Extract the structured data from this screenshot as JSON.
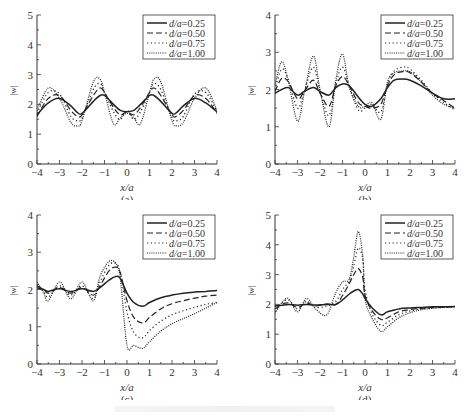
{
  "figure": {
    "panels": [
      {
        "label": "(a)",
        "xlabel": "x/a",
        "ylabel": "|w|"
      },
      {
        "label": "(b)",
        "xlabel": "x/a",
        "ylabel": "|w|"
      },
      {
        "label": "(c)",
        "xlabel": "x/a",
        "ylabel": "|w|"
      },
      {
        "label": "(d)",
        "xlabel": "x/a",
        "ylabel": "|w|"
      }
    ]
  },
  "chart_data": [
    {
      "type": "line",
      "title": "(a)",
      "xlabel": "x/a",
      "ylabel": "|w|",
      "xlim": [
        -4,
        4
      ],
      "ylim": [
        0,
        5
      ],
      "xticks": [
        -4,
        -3,
        -2,
        -1,
        0,
        1,
        2,
        3,
        4
      ],
      "yticks": [
        0,
        1,
        2,
        3,
        4,
        5
      ],
      "grid": false,
      "legend_position": "upper right",
      "x": [
        -4,
        -3.5,
        -3,
        -2.5,
        -2.2,
        -2,
        -1.5,
        -1.2,
        -1,
        -0.6,
        -0.3,
        0,
        0.3,
        0.6,
        1,
        1.2,
        1.5,
        2,
        2.2,
        2.5,
        3,
        3.5,
        4
      ],
      "series": [
        {
          "name": "d/a=0.25",
          "style": "solid",
          "values": [
            1.65,
            2.05,
            2.2,
            1.95,
            1.72,
            1.7,
            2.1,
            2.3,
            2.3,
            2.0,
            1.8,
            1.75,
            1.8,
            2.0,
            2.3,
            2.3,
            2.1,
            1.7,
            1.72,
            1.95,
            2.2,
            2.05,
            1.75
          ]
        },
        {
          "name": "d/a=0.50",
          "style": "dashed",
          "values": [
            1.6,
            2.2,
            2.3,
            1.8,
            1.6,
            1.65,
            2.3,
            2.55,
            2.4,
            1.9,
            1.65,
            1.75,
            1.65,
            1.9,
            2.4,
            2.55,
            2.3,
            1.65,
            1.6,
            1.8,
            2.3,
            2.2,
            1.7
          ]
        },
        {
          "name": "d/a=0.75",
          "style": "dotted",
          "values": [
            1.7,
            2.4,
            2.35,
            1.6,
            1.45,
            1.55,
            2.5,
            2.7,
            2.4,
            1.75,
            1.5,
            1.8,
            1.5,
            1.75,
            2.4,
            2.7,
            2.5,
            1.55,
            1.45,
            1.6,
            2.35,
            2.4,
            1.75
          ]
        },
        {
          "name": "d/a=1.00",
          "style": "dense-dotted",
          "values": [
            1.8,
            2.55,
            2.2,
            1.4,
            1.28,
            1.45,
            2.75,
            2.85,
            2.4,
            1.35,
            1.55,
            1.7,
            1.55,
            1.35,
            2.4,
            2.85,
            2.75,
            1.45,
            1.28,
            1.4,
            2.2,
            2.55,
            1.8
          ]
        }
      ]
    },
    {
      "type": "line",
      "title": "(b)",
      "xlabel": "x/a",
      "ylabel": "|w|",
      "xlim": [
        -4,
        4
      ],
      "ylim": [
        0,
        4
      ],
      "xticks": [
        -4,
        -3,
        -2,
        -1,
        0,
        1,
        2,
        3,
        4
      ],
      "yticks": [
        0,
        1,
        2,
        3,
        4
      ],
      "grid": false,
      "legend_position": "upper right",
      "x": [
        -4,
        -3.7,
        -3.4,
        -3,
        -2.7,
        -2.3,
        -2,
        -1.6,
        -1.3,
        -1,
        -0.7,
        -0.3,
        0,
        0.3,
        0.7,
        1,
        1.3,
        1.7,
        2,
        2.5,
        3,
        3.5,
        4
      ],
      "series": [
        {
          "name": "d/a=0.25",
          "style": "solid",
          "values": [
            1.9,
            2.0,
            2.05,
            1.85,
            1.95,
            2.05,
            1.95,
            1.85,
            2.05,
            2.15,
            2.1,
            1.8,
            1.6,
            1.55,
            1.75,
            2.05,
            2.25,
            2.28,
            2.25,
            2.1,
            1.9,
            1.75,
            1.75
          ]
        },
        {
          "name": "d/a=0.50",
          "style": "dashed",
          "values": [
            1.95,
            2.3,
            2.2,
            1.75,
            1.95,
            2.25,
            1.9,
            1.55,
            2.1,
            2.35,
            2.1,
            1.65,
            1.55,
            1.5,
            1.6,
            2.1,
            2.4,
            2.48,
            2.45,
            2.2,
            1.9,
            1.7,
            1.5
          ]
        },
        {
          "name": "d/a=0.75",
          "style": "dotted",
          "values": [
            2.0,
            2.55,
            2.25,
            1.5,
            1.95,
            2.6,
            1.95,
            1.3,
            2.15,
            2.6,
            2.1,
            1.45,
            1.5,
            1.6,
            1.4,
            2.15,
            2.5,
            2.6,
            2.55,
            2.25,
            1.9,
            1.65,
            1.45
          ]
        },
        {
          "name": "d/a=1.00",
          "style": "dense-dotted",
          "values": [
            2.1,
            2.75,
            2.2,
            1.15,
            1.9,
            2.9,
            2.0,
            1.0,
            2.25,
            2.95,
            2.05,
            1.55,
            1.55,
            1.65,
            1.2,
            2.2,
            2.45,
            2.5,
            2.48,
            2.2,
            1.85,
            1.6,
            1.5
          ]
        }
      ]
    },
    {
      "type": "line",
      "title": "(c)",
      "xlabel": "x/a",
      "ylabel": "|w|",
      "xlim": [
        -4,
        4
      ],
      "ylim": [
        0,
        4
      ],
      "xticks": [
        -4,
        -3,
        -2,
        -1,
        0,
        1,
        2,
        3,
        4
      ],
      "yticks": [
        0,
        1,
        2,
        3,
        4
      ],
      "grid": false,
      "legend_position": "upper right",
      "x": [
        -4,
        -3.7,
        -3.5,
        -3,
        -2.5,
        -2,
        -1.5,
        -1.2,
        -0.8,
        -0.5,
        -0.3,
        0,
        0.3,
        0.7,
        1,
        1.5,
        2,
        2.5,
        3,
        3.5,
        4
      ],
      "series": [
        {
          "name": "d/a=0.25",
          "style": "solid",
          "values": [
            2.05,
            2.0,
            1.95,
            2.02,
            1.95,
            2.02,
            1.95,
            2.05,
            2.25,
            2.35,
            2.3,
            1.9,
            1.65,
            1.55,
            1.65,
            1.78,
            1.85,
            1.9,
            1.93,
            1.95,
            1.97
          ]
        },
        {
          "name": "d/a=0.50",
          "style": "dashed",
          "values": [
            2.1,
            2.0,
            1.9,
            2.05,
            1.9,
            2.05,
            1.85,
            2.1,
            2.5,
            2.6,
            2.45,
            1.7,
            1.25,
            1.1,
            1.25,
            1.48,
            1.62,
            1.7,
            1.77,
            1.82,
            1.85
          ]
        },
        {
          "name": "d/a=0.75",
          "style": "dotted",
          "values": [
            2.15,
            1.95,
            1.8,
            2.1,
            1.85,
            2.1,
            1.75,
            2.2,
            2.65,
            2.7,
            2.45,
            1.4,
            0.85,
            0.7,
            0.9,
            1.15,
            1.32,
            1.43,
            1.52,
            1.6,
            1.65
          ]
        },
        {
          "name": "d/a=1.00",
          "style": "dense-dotted",
          "values": [
            2.2,
            1.9,
            1.7,
            2.2,
            1.75,
            2.2,
            1.7,
            2.35,
            2.75,
            2.7,
            2.3,
            0.5,
            0.5,
            0.42,
            0.6,
            0.88,
            1.08,
            1.22,
            1.35,
            1.5,
            1.65
          ]
        }
      ]
    },
    {
      "type": "line",
      "title": "(d)",
      "xlabel": "x/a",
      "ylabel": "|w|",
      "xlim": [
        -4,
        4
      ],
      "ylim": [
        0,
        5
      ],
      "xticks": [
        -4,
        -3,
        -2,
        -1,
        0,
        1,
        2,
        3,
        4
      ],
      "yticks": [
        0,
        1,
        2,
        3,
        4,
        5
      ],
      "grid": false,
      "legend_position": "upper right",
      "x": [
        -4,
        -3.7,
        -3.4,
        -3,
        -2.6,
        -2.2,
        -1.7,
        -1.3,
        -1,
        -0.7,
        -0.5,
        -0.3,
        -0.1,
        0,
        0.3,
        0.7,
        1,
        1.5,
        2,
        2.5,
        3,
        3.5,
        4
      ],
      "series": [
        {
          "name": "d/a=0.25",
          "style": "solid",
          "values": [
            1.95,
            1.97,
            2.0,
            1.97,
            2.0,
            1.98,
            2.0,
            2.0,
            2.15,
            2.35,
            2.45,
            2.5,
            2.35,
            2.2,
            1.9,
            1.65,
            1.75,
            1.85,
            1.88,
            1.9,
            1.92,
            1.92,
            1.93
          ]
        },
        {
          "name": "d/a=0.50",
          "style": "dashed",
          "values": [
            1.85,
            2.0,
            2.05,
            1.9,
            2.05,
            1.95,
            2.02,
            2.0,
            2.3,
            2.7,
            3.0,
            3.2,
            2.9,
            2.3,
            1.8,
            1.5,
            1.55,
            1.75,
            1.83,
            1.87,
            1.9,
            1.91,
            1.93
          ]
        },
        {
          "name": "d/a=0.75",
          "style": "dotted",
          "values": [
            1.75,
            2.05,
            2.15,
            1.85,
            2.1,
            1.9,
            1.95,
            2.1,
            2.5,
            2.8,
            3.3,
            3.9,
            3.5,
            2.5,
            1.7,
            1.3,
            1.4,
            1.65,
            1.78,
            1.85,
            1.88,
            1.9,
            1.92
          ]
        },
        {
          "name": "d/a=1.00",
          "style": "dense-dotted",
          "values": [
            1.7,
            2.05,
            2.2,
            1.75,
            2.2,
            1.85,
            1.65,
            2.4,
            2.75,
            2.85,
            3.6,
            4.45,
            3.6,
            2.2,
            1.55,
            1.1,
            1.25,
            1.55,
            1.72,
            1.82,
            1.87,
            1.9,
            1.92
          ]
        }
      ]
    }
  ]
}
